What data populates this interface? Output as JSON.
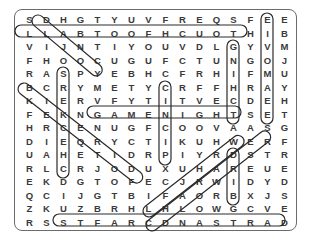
{
  "puzzle": {
    "type": "word-search",
    "columns": 16,
    "rows": 16,
    "grid": [
      [
        "S",
        "D",
        "H",
        "G",
        "T",
        "Y",
        "U",
        "V",
        "F",
        "R",
        "E",
        "Q",
        "S",
        "F",
        "E",
        "E"
      ],
      [
        "L",
        "L",
        "A",
        "B",
        "T",
        "O",
        "O",
        "F",
        "H",
        "C",
        "U",
        "O",
        "T",
        "H",
        "I",
        "B"
      ],
      [
        "V",
        "I",
        "J",
        "N",
        "T",
        "I",
        "Y",
        "O",
        "U",
        "V",
        "D",
        "L",
        "G",
        "Y",
        "V",
        "M"
      ],
      [
        "F",
        "H",
        "O",
        "O",
        "C",
        "U",
        "G",
        "U",
        "F",
        "C",
        "T",
        "U",
        "N",
        "G",
        "O",
        "J"
      ],
      [
        "R",
        "A",
        "S",
        "P",
        "Y",
        "E",
        "B",
        "H",
        "C",
        "F",
        "R",
        "H",
        "I",
        "F",
        "M",
        "U"
      ],
      [
        "B",
        "C",
        "R",
        "Y",
        "M",
        "E",
        "T",
        "Y",
        "C",
        "R",
        "F",
        "F",
        "H",
        "R",
        "A",
        "Y"
      ],
      [
        "K",
        "I",
        "E",
        "R",
        "V",
        "F",
        "Y",
        "T",
        "I",
        "T",
        "V",
        "E",
        "C",
        "D",
        "E",
        "H"
      ],
      [
        "F",
        "E",
        "K",
        "N",
        "G",
        "A",
        "M",
        "E",
        "N",
        "I",
        "G",
        "H",
        "T",
        "S",
        "E",
        "T"
      ],
      [
        "H",
        "R",
        "C",
        "E",
        "N",
        "U",
        "G",
        "F",
        "C",
        "O",
        "O",
        "V",
        "A",
        "A",
        "S",
        "G"
      ],
      [
        "D",
        "I",
        "E",
        "Q",
        "R",
        "Y",
        "C",
        "T",
        "I",
        "K",
        "U",
        "H",
        "W",
        "E",
        "R",
        "F"
      ],
      [
        "U",
        "A",
        "H",
        "E",
        "T",
        "I",
        "D",
        "R",
        "P",
        "I",
        "Y",
        "R",
        "D",
        "S",
        "T",
        "R"
      ],
      [
        "R",
        "L",
        "C",
        "R",
        "J",
        "O",
        "D",
        "U",
        "X",
        "U",
        "H",
        "A",
        "R",
        "E",
        "U",
        "E"
      ],
      [
        "E",
        "K",
        "D",
        "G",
        "T",
        "O",
        "F",
        "E",
        "C",
        "J",
        "R",
        "W",
        "I",
        "D",
        "Y",
        "D"
      ],
      [
        "Q",
        "C",
        "I",
        "J",
        "G",
        "T",
        "B",
        "I",
        "F",
        "A",
        "O",
        "R",
        "B",
        "X",
        "J",
        "S"
      ],
      [
        "Z",
        "K",
        "U",
        "Z",
        "B",
        "R",
        "H",
        "L",
        "H",
        "L",
        "O",
        "W",
        "G",
        "C",
        "V",
        "E"
      ],
      [
        "R",
        "S",
        "S",
        "T",
        "F",
        "A",
        "R",
        "C",
        "D",
        "N",
        "A",
        "S",
        "T",
        "R",
        "A",
        "D"
      ]
    ],
    "found_words": [
      {
        "word": "LLABTOOFHCUOT",
        "direction": "horizontal",
        "start": [
          1,
          0
        ],
        "end": [
          1,
          12
        ]
      },
      {
        "word": "GAMENIGHT",
        "direction": "horizontal",
        "start": [
          7,
          4
        ],
        "end": [
          7,
          12
        ]
      },
      {
        "word": "STFARCDNASTRA",
        "direction": "horizontal",
        "start": [
          15,
          2
        ],
        "end": [
          15,
          14
        ]
      },
      {
        "word": "EIVOMAEE",
        "direction": "vertical",
        "start": [
          0,
          14
        ],
        "end": [
          7,
          14
        ]
      },
      {
        "word": "GNIHCT",
        "direction": "vertical",
        "start": [
          2,
          12
        ],
        "end": [
          7,
          12
        ]
      },
      {
        "word": "SREKCEHC",
        "direction": "vertical",
        "start": [
          4,
          2
        ],
        "end": [
          11,
          2
        ]
      },
      {
        "word": "CINCIP",
        "direction": "vertical",
        "start": [
          5,
          8
        ],
        "end": [
          10,
          8
        ]
      },
      {
        "word": "DRIB",
        "direction": "vertical",
        "start": [
          10,
          12
        ],
        "end": [
          13,
          12
        ]
      },
      {
        "word": "DANCE",
        "direction": "diagonal",
        "start": [
          0,
          1
        ],
        "end": [
          4,
          5
        ]
      },
      {
        "word": "BIKERIDE",
        "direction": "diagonal",
        "start": [
          5,
          0
        ],
        "end": [
          12,
          7
        ]
      },
      {
        "word": "CHARADES",
        "direction": "diagonal",
        "start": [
          15,
          7
        ],
        "end": [
          8,
          14
        ]
      },
      {
        "word": "LHRWAS",
        "direction": "diagonal",
        "start": [
          14,
          7
        ],
        "end": [
          8,
          13
        ]
      }
    ]
  }
}
